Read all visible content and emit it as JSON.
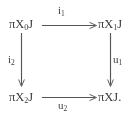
{
  "diagram": {
    "kind": "commutative-square",
    "background_color": "#ffffff",
    "ink_color": "#3d3d3d",
    "arrow_color": "#565656",
    "nodes": [
      {
        "id": "top-left",
        "base": "πX",
        "subscript": "0",
        "suffix": "J",
        "full": "πX₀J"
      },
      {
        "id": "top-right",
        "base": "πX",
        "subscript": "1",
        "suffix": "J",
        "full": "πX₁J"
      },
      {
        "id": "bottom-left",
        "base": "πX",
        "subscript": "2",
        "suffix": "J",
        "full": "πX₂J"
      },
      {
        "id": "bottom-right",
        "base": "πX",
        "subscript": "",
        "suffix": "J.",
        "full": "πXJ."
      }
    ],
    "arrows": [
      {
        "id": "top",
        "base": "i",
        "subscript": "1",
        "full": "i₁",
        "from": "top-left",
        "to": "top-right",
        "direction": "right"
      },
      {
        "id": "left",
        "base": "i",
        "subscript": "2",
        "full": "i₂",
        "from": "top-left",
        "to": "bottom-left",
        "direction": "down"
      },
      {
        "id": "right",
        "base": "u",
        "subscript": "1",
        "full": "u₁",
        "from": "top-right",
        "to": "bottom-right",
        "direction": "down"
      },
      {
        "id": "bottom",
        "base": "u",
        "subscript": "2",
        "full": "u₂",
        "from": "bottom-left",
        "to": "bottom-right",
        "direction": "right"
      }
    ]
  }
}
